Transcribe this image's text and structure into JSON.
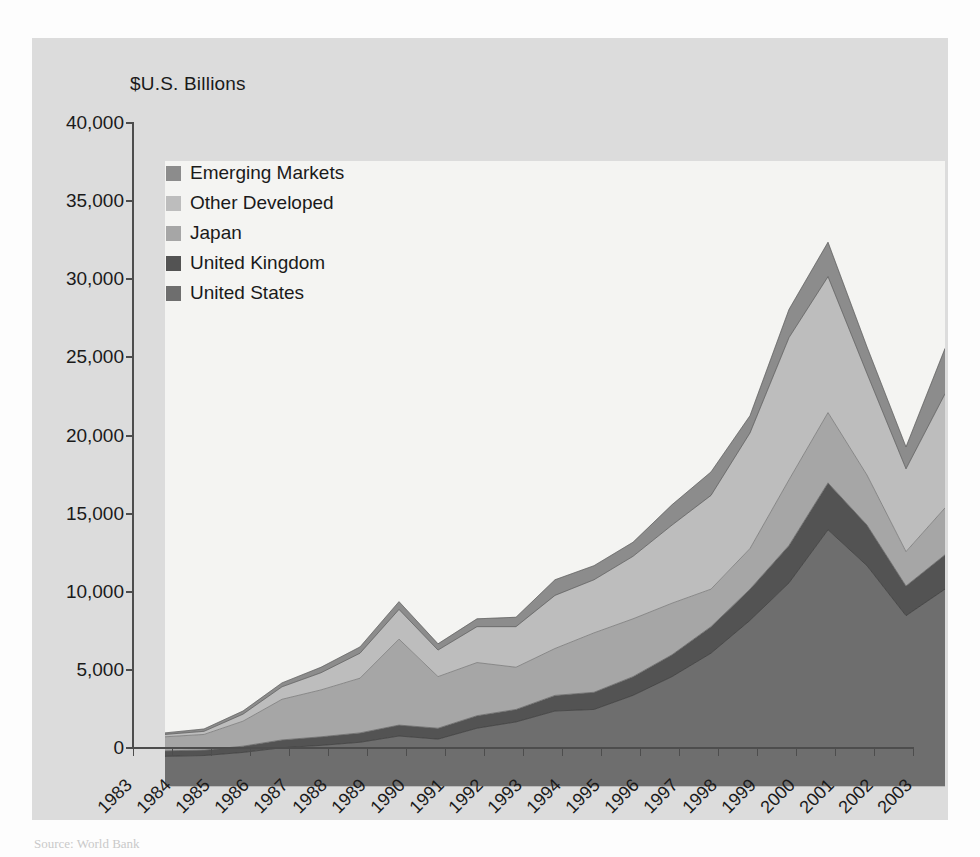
{
  "chart": {
    "axis_title": "$U.S. Billions",
    "source_note": "Source: World Bank"
  },
  "legend": {
    "items": [
      {
        "label": "Emerging Markets",
        "color": "#8c8c8c"
      },
      {
        "label": "Other Developed",
        "color": "#bdbdbd"
      },
      {
        "label": "Japan",
        "color": "#a6a6a6"
      },
      {
        "label": "United Kingdom",
        "color": "#535353"
      },
      {
        "label": "United States",
        "color": "#6e6e6e"
      }
    ]
  },
  "chart_data": {
    "type": "area",
    "stacked": true,
    "title": "",
    "subtitle": "",
    "xlabel": "",
    "ylabel": "$U.S. Billions",
    "ylim": [
      0,
      40000
    ],
    "ytick_step": 5000,
    "ytick_labels": [
      "0",
      "5,000",
      "10,000",
      "15,000",
      "20,000",
      "25,000",
      "30,000",
      "35,000",
      "40,000"
    ],
    "ytick_values": [
      0,
      5000,
      10000,
      15000,
      20000,
      25000,
      30000,
      35000,
      40000
    ],
    "grid": false,
    "legend_position": "inside-top-left",
    "categories": [
      "1983",
      "1984",
      "1985",
      "1986",
      "1987",
      "1988",
      "1989",
      "1990",
      "1991",
      "1992",
      "1993",
      "1994",
      "1995",
      "1996",
      "1997",
      "1998",
      "1999",
      "2000",
      "2001",
      "2002",
      "2003"
    ],
    "series": [
      {
        "name": "United States",
        "color": "#6e6e6e",
        "values": [
          1900,
          1950,
          2150,
          2450,
          2600,
          2800,
          3200,
          3000,
          3700,
          4100,
          4800,
          4900,
          5800,
          7000,
          8500,
          10600,
          13000,
          16400,
          14100,
          10900,
          12600
        ]
      },
      {
        "name": "United Kingdom",
        "color": "#535353",
        "values": [
          350,
          350,
          400,
          500,
          550,
          600,
          700,
          700,
          800,
          800,
          1000,
          1100,
          1200,
          1400,
          1700,
          2000,
          2400,
          3000,
          2600,
          1900,
          2200
        ]
      },
      {
        "name": "Japan",
        "color": "#a6a6a6",
        "values": [
          900,
          1000,
          1600,
          2600,
          3000,
          3500,
          5500,
          3300,
          3400,
          2700,
          3000,
          3800,
          3700,
          3300,
          2400,
          2600,
          4200,
          4500,
          3200,
          2200,
          3000
        ]
      },
      {
        "name": "Other Developed",
        "color": "#bdbdbd",
        "values": [
          150,
          200,
          450,
          800,
          1100,
          1600,
          1900,
          1700,
          2300,
          2600,
          3400,
          3400,
          4000,
          5000,
          6000,
          7400,
          9100,
          8700,
          6500,
          5300,
          7300
        ]
      },
      {
        "name": "Emerging Markets",
        "color": "#8c8c8c",
        "values": [
          100,
          150,
          200,
          250,
          350,
          400,
          500,
          400,
          500,
          600,
          1000,
          900,
          900,
          1300,
          1500,
          1100,
          1800,
          2200,
          1700,
          1400,
          2900
        ]
      }
    ]
  }
}
